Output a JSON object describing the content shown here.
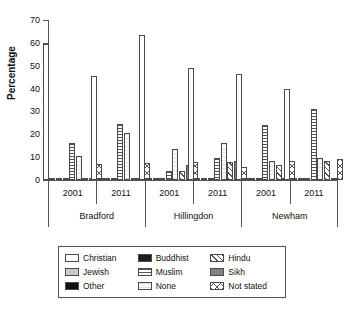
{
  "chart_data": {
    "type": "bar",
    "title": "",
    "xlabel": "",
    "ylabel": "Percentage",
    "ylim": [
      0,
      70
    ],
    "yticks": [
      0,
      10,
      20,
      30,
      40,
      50,
      60,
      70
    ],
    "grid": false,
    "legend_position": "below-plot",
    "groups": [
      {
        "district": "Bradford",
        "year": "2001"
      },
      {
        "district": "Bradford",
        "year": "2011"
      },
      {
        "district": "Hillingdon",
        "year": "2001"
      },
      {
        "district": "Hillingdon",
        "year": "2011"
      },
      {
        "district": "Newham",
        "year": "2001"
      },
      {
        "district": "Newham",
        "year": "2011"
      }
    ],
    "districts": [
      "Bradford",
      "Hillingdon",
      "Newham"
    ],
    "years": [
      "2001",
      "2011"
    ],
    "categories": [
      "Bradford 2001",
      "Bradford 2011",
      "Hillingdon 2001",
      "Hillingdon 2011",
      "Newham 2001",
      "Newham 2011"
    ],
    "series": [
      {
        "name": "Christian",
        "key": "christian",
        "values": [
          59.5,
          45.5,
          63.5,
          49.0,
          46.5,
          40.0
        ]
      },
      {
        "name": "Jewish",
        "key": "jewish",
        "values": [
          0.2,
          0.1,
          0.6,
          0.5,
          0.4,
          0.3
        ]
      },
      {
        "name": "Other",
        "key": "other",
        "values": [
          0.2,
          0.3,
          0.3,
          0.4,
          0.3,
          0.4
        ]
      },
      {
        "name": "Buddhist",
        "key": "buddhist",
        "values": [
          0.2,
          0.2,
          0.6,
          0.7,
          0.5,
          0.6
        ]
      },
      {
        "name": "Muslim",
        "key": "muslim",
        "values": [
          16.0,
          24.5,
          4.0,
          9.5,
          24.0,
          31.0
        ]
      },
      {
        "name": "None",
        "key": "none",
        "values": [
          10.5,
          20.5,
          13.5,
          16.0,
          8.5,
          9.5
        ]
      },
      {
        "name": "Hindu",
        "key": "hindu",
        "values": [
          0.9,
          0.9,
          4.0,
          8.0,
          6.5,
          8.5
        ]
      },
      {
        "name": "Sikh",
        "key": "sikh",
        "values": [
          0.6,
          0.6,
          6.5,
          8.5,
          0.8,
          1.0
        ]
      },
      {
        "name": "Not stated",
        "key": "notstated",
        "values": [
          7.0,
          7.5,
          8.0,
          5.5,
          8.5,
          9.0
        ]
      }
    ]
  },
  "axis": {
    "ylabel": "Percentage",
    "ytick_labels": [
      "0",
      "10",
      "20",
      "30",
      "40",
      "50",
      "60",
      "70"
    ]
  },
  "legend": {
    "items": [
      {
        "label": "Christian",
        "key": "christian"
      },
      {
        "label": "Buddhist",
        "key": "buddhist"
      },
      {
        "label": "Hindu",
        "key": "hindu"
      },
      {
        "label": "Jewish",
        "key": "jewish"
      },
      {
        "label": "Muslim",
        "key": "muslim"
      },
      {
        "label": "Sikh",
        "key": "sikh"
      },
      {
        "label": "Other",
        "key": "other"
      },
      {
        "label": "None",
        "key": "none"
      },
      {
        "label": "Not stated",
        "key": "notstated"
      }
    ]
  },
  "caption": ""
}
